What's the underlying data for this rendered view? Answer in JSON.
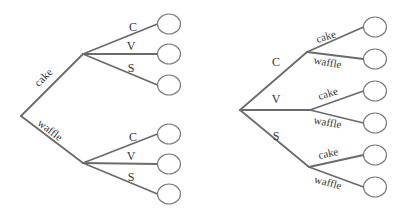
{
  "trees": [
    {
      "name": "dessert-first",
      "root": {
        "x": 21,
        "y": 116
      },
      "branches": [
        {
          "label": "cake",
          "node": {
            "x": 83,
            "y": 54
          },
          "label_pos": {
            "x": 46,
            "y": 80,
            "rotate": -45
          },
          "children": [
            {
              "label": "C",
              "label_pos": {
                "x": 133,
                "y": 31
              },
              "leaf": {
                "x": 169,
                "y": 24
              }
            },
            {
              "label": "V",
              "label_pos": {
                "x": 131,
                "y": 50
              },
              "leaf": {
                "x": 169,
                "y": 54
              }
            },
            {
              "label": "S",
              "label_pos": {
                "x": 131,
                "y": 72
              },
              "leaf": {
                "x": 169,
                "y": 85
              }
            }
          ]
        },
        {
          "label": "waffle",
          "node": {
            "x": 83,
            "y": 163
          },
          "label_pos": {
            "x": 48,
            "y": 133,
            "rotate": 37
          },
          "children": [
            {
              "label": "C",
              "label_pos": {
                "x": 133,
                "y": 141
              },
              "leaf": {
                "x": 169,
                "y": 134
              }
            },
            {
              "label": "V",
              "label_pos": {
                "x": 131,
                "y": 160
              },
              "leaf": {
                "x": 169,
                "y": 164
              }
            },
            {
              "label": "S",
              "label_pos": {
                "x": 131,
                "y": 181
              },
              "leaf": {
                "x": 169,
                "y": 194
              }
            }
          ]
        }
      ]
    },
    {
      "name": "topping-first",
      "root": {
        "x": 240,
        "y": 110
      },
      "branches": [
        {
          "label": "C",
          "node": {
            "x": 307,
            "y": 52
          },
          "label_pos": {
            "x": 276,
            "y": 66,
            "rotate": 0
          },
          "children": [
            {
              "label": "cake",
              "label_pos": {
                "x": 327,
                "y": 40,
                "rotate": -18
              },
              "leaf": {
                "x": 375,
                "y": 27
              }
            },
            {
              "label": "waffle",
              "label_pos": {
                "x": 327,
                "y": 66,
                "rotate": 10
              },
              "leaf": {
                "x": 375,
                "y": 59
              }
            }
          ]
        },
        {
          "label": "V",
          "node": {
            "x": 310,
            "y": 110
          },
          "label_pos": {
            "x": 276,
            "y": 103,
            "rotate": 0
          },
          "children": [
            {
              "label": "cake",
              "label_pos": {
                "x": 329,
                "y": 97,
                "rotate": -18
              },
              "leaf": {
                "x": 375,
                "y": 91
              }
            },
            {
              "label": "waffle",
              "label_pos": {
                "x": 327,
                "y": 126,
                "rotate": 10
              },
              "leaf": {
                "x": 375,
                "y": 123
              }
            }
          ]
        },
        {
          "label": "S",
          "node": {
            "x": 309,
            "y": 167
          },
          "label_pos": {
            "x": 276,
            "y": 140,
            "rotate": 0
          },
          "children": [
            {
              "label": "cake",
              "label_pos": {
                "x": 329,
                "y": 157,
                "rotate": -12
              },
              "leaf": {
                "x": 375,
                "y": 155
              }
            },
            {
              "label": "waffle",
              "label_pos": {
                "x": 327,
                "y": 186,
                "rotate": 15
              },
              "leaf": {
                "x": 375,
                "y": 187
              }
            }
          ]
        }
      ]
    }
  ],
  "leaf_shape": {
    "rx": 11.5,
    "ry": 10
  },
  "colors": {
    "edge": "#6b6b6b",
    "leaf_stroke": "#7a7a7a",
    "text": "#333333",
    "background": "#ffffff"
  }
}
